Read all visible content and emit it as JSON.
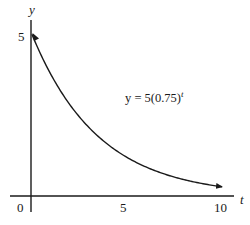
{
  "chart_data": {
    "type": "line",
    "title": "",
    "function": "y = 5(0.75)^t",
    "xlabel": "t",
    "ylabel": "y",
    "xlim": [
      0,
      10
    ],
    "ylim": [
      0,
      5
    ],
    "x_ticks": [
      "0",
      "5",
      "10"
    ],
    "y_ticks": [
      "5"
    ],
    "grid": false,
    "legend": null,
    "annotation": {
      "text_main": "y = 5(0.75)",
      "text_exponent": "t"
    },
    "series": [
      {
        "name": "y = 5(0.75)^t",
        "x": [
          0,
          1,
          2,
          3,
          4,
          5,
          6,
          7,
          8,
          9,
          10
        ],
        "values": [
          5.0,
          3.75,
          2.81,
          2.11,
          1.58,
          1.19,
          0.89,
          0.67,
          0.5,
          0.38,
          0.28
        ]
      }
    ]
  },
  "labels": {
    "x_axis": "t",
    "y_axis": "y",
    "x_tick_0": "0",
    "x_tick_5": "5",
    "x_tick_10": "10",
    "y_tick_5": "5",
    "equation_main": "y = 5(0.75)",
    "equation_exp": "t"
  },
  "colors": {
    "axis": "#1a1a1a",
    "curve": "#1a1a1a",
    "background": "#ffffff"
  }
}
